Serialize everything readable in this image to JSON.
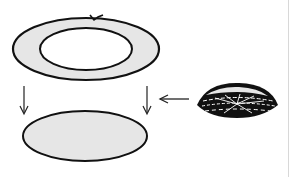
{
  "diagram": {
    "type": "assembly-illustration",
    "elements": [
      {
        "id": "ring",
        "label": "",
        "description": "flat annular ring (gray fill, white center)"
      },
      {
        "id": "disc",
        "label": "",
        "description": "solid flat oval disc (gray fill)"
      },
      {
        "id": "dome",
        "label": "",
        "description": "dome-shaped mesh/cage object with radial pattern"
      }
    ],
    "arrows": [
      {
        "from": "ring-left-edge",
        "to": "disc-left-edge",
        "direction": "down"
      },
      {
        "from": "ring-right-edge",
        "to": "disc-right-edge",
        "direction": "down"
      },
      {
        "from": "dome",
        "to": "assembly",
        "direction": "left"
      }
    ],
    "colors": {
      "fill": "#e6e6e6",
      "stroke": "#111111",
      "background": "#ffffff"
    }
  }
}
